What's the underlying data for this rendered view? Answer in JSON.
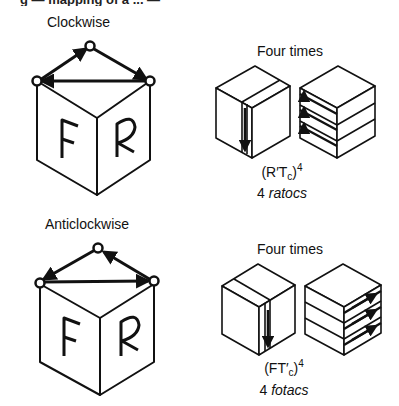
{
  "figure": {
    "header_fragment": "g — mapping of a ... —",
    "panels": [
      {
        "id": "clockwise",
        "title": "Clockwise",
        "cube_faces": {
          "left": "F",
          "right": "R"
        },
        "cycle_direction": "clockwise",
        "repeat_label": "Four times",
        "formula": {
          "base": "(R′T",
          "subscript": "c",
          "close": ")",
          "power": "4"
        },
        "caption": {
          "count": "4",
          "name": "ratocs"
        }
      },
      {
        "id": "anticlockwise",
        "title": "Anticlockwise",
        "cube_faces": {
          "left": "F",
          "right": "R"
        },
        "cycle_direction": "anticlockwise",
        "repeat_label": "Four times",
        "formula": {
          "base": "(FT′",
          "subscript": "c",
          "close": ")",
          "power": "4"
        },
        "caption": {
          "count": "4",
          "name": "fotacs"
        }
      }
    ]
  },
  "colors": {
    "ink": "#111111",
    "background": "#ffffff"
  }
}
